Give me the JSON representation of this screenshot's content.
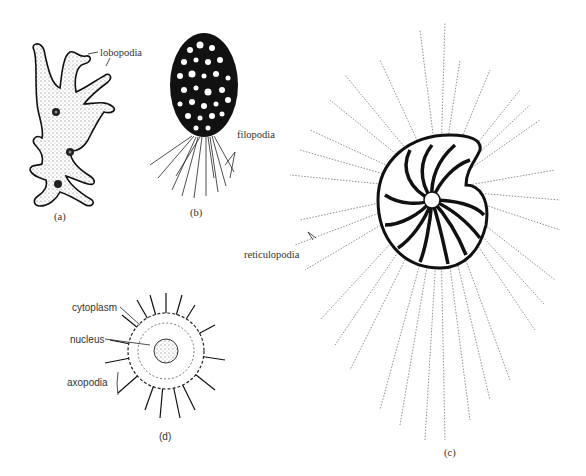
{
  "figure": {
    "panels": [
      {
        "id": "a",
        "caption": "(a)",
        "organism": "amoeba",
        "labels": [
          "lobopodia"
        ]
      },
      {
        "id": "b",
        "caption": "(b)",
        "organism": "testate amoeba",
        "labels": [
          "filopodia"
        ]
      },
      {
        "id": "c",
        "caption": "(c)",
        "organism": "foraminiferan",
        "labels": [
          "reticulopodia"
        ]
      },
      {
        "id": "d",
        "caption": "(d)",
        "organism": "heliozoan",
        "labels": [
          "cytoplasm",
          "nucleus",
          "axopodia"
        ]
      }
    ]
  },
  "labels": {
    "lobopodia": "lobopodia",
    "filopodia": "filopodia",
    "reticulopodia": "reticulopodia",
    "cytoplasm": "cytoplasm",
    "nucleus": "nucleus",
    "axopodia": "axopodia"
  },
  "captions": {
    "a": "(a)",
    "b": "(b)",
    "c": "(c)",
    "d": "(d)"
  }
}
